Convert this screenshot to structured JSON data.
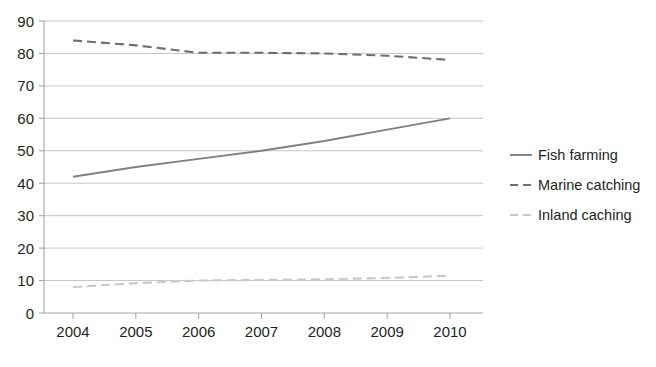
{
  "chart_data": {
    "type": "line",
    "title": "",
    "xlabel": "",
    "ylabel": "",
    "categories": [
      "2004",
      "2005",
      "2006",
      "2007",
      "2008",
      "2009",
      "2010"
    ],
    "x": [
      2004,
      2005,
      2006,
      2007,
      2008,
      2009,
      2010
    ],
    "ylim": [
      0,
      90
    ],
    "yticks": [
      "0",
      "10",
      "20",
      "30",
      "40",
      "50",
      "60",
      "70",
      "80",
      "90"
    ],
    "ytick_values": [
      0,
      10,
      20,
      30,
      40,
      50,
      60,
      70,
      80,
      90
    ],
    "grid": true,
    "legend_position": "right",
    "series": [
      {
        "name": "Fish farming",
        "style": "solid",
        "color": "#808080",
        "values": [
          42,
          45,
          47.5,
          50,
          53,
          56.5,
          60
        ]
      },
      {
        "name": "Marine catching",
        "style": "dashed",
        "color": "#6e6e6e",
        "values": [
          84,
          82.5,
          80.2,
          80.2,
          80,
          79.3,
          78
        ]
      },
      {
        "name": "Inland caching",
        "style": "dashed",
        "color": "#c9c9c9",
        "values": [
          8,
          9.2,
          10,
          10.2,
          10.4,
          10.8,
          11.5
        ]
      }
    ]
  },
  "legend": {
    "items": [
      {
        "label": "Fish farming",
        "swatch": "solid-line-swatch"
      },
      {
        "label": "Marine catching",
        "swatch": "dashed-line-swatch"
      },
      {
        "label": "Inland caching",
        "swatch": "light-dashed-line-swatch"
      }
    ]
  },
  "colors": {
    "fish_farming": "#808080",
    "marine_catching": "#6e6e6e",
    "inland_caching": "#c9c9c9",
    "gridline": "#bfbfbf",
    "axis": "#a6a6a6",
    "text": "#231f20",
    "background": "#ffffff"
  }
}
